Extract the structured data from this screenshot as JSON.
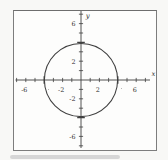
{
  "figure": {
    "background": "#f8f8f6",
    "frame_color": "#7d7d7d",
    "ink_color": "#3f3f3f",
    "text_color": "#2e2e2e",
    "smudge_color": "#bcbcbc"
  },
  "chart_data": {
    "type": "line",
    "shape": "circle",
    "title": "",
    "equation_radius": 4,
    "circle": {
      "center_x": 0,
      "center_y": 0,
      "radius": 4
    },
    "intercepts": [
      [
        -4,
        0
      ],
      [
        4,
        0
      ],
      [
        0,
        4
      ],
      [
        0,
        -4
      ]
    ],
    "xlabel": "x",
    "ylabel": "y",
    "xlim": [
      -7,
      7
    ],
    "ylim": [
      -7,
      7
    ],
    "tick_step": 1,
    "emphasized_ticks": [
      -4,
      4
    ],
    "grid": false,
    "legend": false,
    "x_tick_labels": [
      {
        "value": -6,
        "label": "-6"
      },
      {
        "value": -2,
        "label": "-2"
      },
      {
        "value": 2,
        "label": "2"
      },
      {
        "value": 6,
        "label": "6"
      }
    ],
    "y_tick_labels": [
      {
        "value": 6,
        "label": "6"
      },
      {
        "value": 2,
        "label": "2"
      },
      {
        "value": -2,
        "label": "-2"
      },
      {
        "value": -6,
        "label": "-6"
      }
    ]
  }
}
